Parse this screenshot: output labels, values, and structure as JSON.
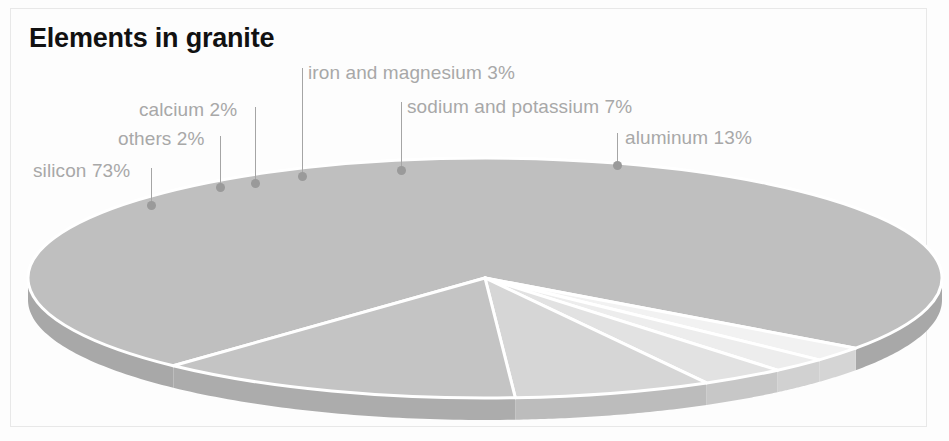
{
  "chart_title": "Elements in granite",
  "chart_data": {
    "type": "pie",
    "title": "Elements in granite",
    "xlabel": "",
    "ylabel": "",
    "legend_position": "none",
    "grid": false,
    "unit": "%",
    "categories": [
      "silicon",
      "others",
      "calcium",
      "iron and magnesium",
      "sodium and potassium",
      "aluminum"
    ],
    "values": [
      73,
      2,
      2,
      3,
      7,
      13
    ],
    "labels": [
      "silicon 73%",
      "others 2%",
      "calcium 2%",
      "iron and magnesium 3%",
      "sodium and potassium 7%",
      "aluminum 13%"
    ],
    "slice_colors": [
      "#bfbfbf",
      "#f2f2f2",
      "#ededed",
      "#e2e2e2",
      "#d6d6d6",
      "#c4c4c4"
    ],
    "annotations": [
      {
        "name": "silicon",
        "text": "silicon 73%",
        "text_x": 33,
        "text_y": 160,
        "line_x": 151,
        "line_top": 168,
        "line_bottom": 203,
        "dot_x": 151,
        "dot_y": 205
      },
      {
        "name": "others",
        "text": "others 2%",
        "text_x": 118,
        "text_y": 128,
        "line_x": 220,
        "line_top": 136,
        "line_bottom": 185,
        "dot_x": 220,
        "dot_y": 187
      },
      {
        "name": "calcium",
        "text": "calcium 2%",
        "text_x": 139,
        "text_y": 99,
        "line_x": 255,
        "line_top": 107,
        "line_bottom": 181,
        "dot_x": 255,
        "dot_y": 183
      },
      {
        "name": "iron-and-magnesium",
        "text": "iron and magnesium 3%",
        "text_x": 308,
        "text_y": 62,
        "line_x": 302,
        "line_top": 68,
        "line_bottom": 174,
        "dot_x": 302,
        "dot_y": 176
      },
      {
        "name": "sodium-and-potassium",
        "text": "sodium and potassium 7%",
        "text_x": 407,
        "text_y": 96,
        "line_x": 401,
        "line_top": 102,
        "line_bottom": 168,
        "dot_x": 401,
        "dot_y": 170
      },
      {
        "name": "aluminum",
        "text": "aluminum 13%",
        "text_x": 625,
        "text_y": 127,
        "line_x": 617,
        "line_top": 133,
        "line_bottom": 163,
        "dot_x": 617,
        "dot_y": 165
      }
    ]
  },
  "colors": {
    "background": "#fdfdfd",
    "frame": "#e8e8e8",
    "title": "#111111",
    "label_text": "#a8a8a8",
    "leader_line": "#a5a5a5",
    "slice_gap": "#ffffff"
  }
}
